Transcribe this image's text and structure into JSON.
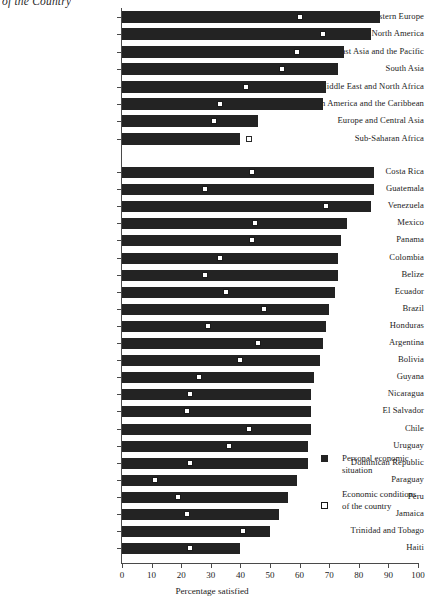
{
  "running_head": "of the Country",
  "chart_data": {
    "type": "bar",
    "title": "",
    "xlabel": "Percentage satisfied",
    "ylabel": "",
    "xlim": [
      0,
      100
    ],
    "xticks": [
      0,
      10,
      20,
      30,
      40,
      50,
      60,
      70,
      80,
      90,
      100
    ],
    "grid": false,
    "legend_position": "right-middle",
    "series": [
      {
        "name": "Personal economic situation",
        "marker": "filled-square-bar",
        "color": "#232323"
      },
      {
        "name": "Economic conditions of the country",
        "marker": "hollow-square",
        "color": "#ffffff"
      }
    ],
    "groups": [
      {
        "name": "regions",
        "categories": [
          "Western Europe",
          "North America",
          "East Asia and the Pacific",
          "South Asia",
          "Middle East and North Africa",
          "Latin America and the Caribbean",
          "Europe and Central Asia",
          "Sub-Saharan Africa"
        ],
        "personal_economic_situation": [
          87,
          84,
          75,
          73,
          69,
          68,
          46,
          40
        ],
        "economic_conditions_of_country": [
          60,
          68,
          59,
          54,
          42,
          33,
          31,
          43
        ]
      },
      {
        "name": "countries",
        "categories": [
          "Costa Rica",
          "Guatemala",
          "Venezuela",
          "Mexico",
          "Panama",
          "Colombia",
          "Belize",
          "Ecuador",
          "Brazil",
          "Honduras",
          "Argentina",
          "Bolivia",
          "Guyana",
          "Nicaragua",
          "El Salvador",
          "Chile",
          "Uruguay",
          "Dominican Republic",
          "Paraguay",
          "Peru",
          "Jamaica",
          "Trinidad and Tobago",
          "Haiti"
        ],
        "personal_economic_situation": [
          85,
          85,
          84,
          76,
          74,
          73,
          73,
          72,
          70,
          69,
          68,
          67,
          65,
          64,
          64,
          64,
          63,
          63,
          59,
          56,
          53,
          50,
          40
        ],
        "economic_conditions_of_country": [
          44,
          28,
          69,
          45,
          44,
          33,
          28,
          35,
          48,
          29,
          46,
          40,
          26,
          23,
          22,
          43,
          36,
          23,
          11,
          19,
          22,
          41,
          23
        ]
      }
    ]
  },
  "legend": {
    "items": [
      {
        "label": "Personal economic situation",
        "swatch": "filled-square"
      },
      {
        "label": "Economic conditions of the country",
        "swatch": "hollow-square"
      }
    ]
  }
}
